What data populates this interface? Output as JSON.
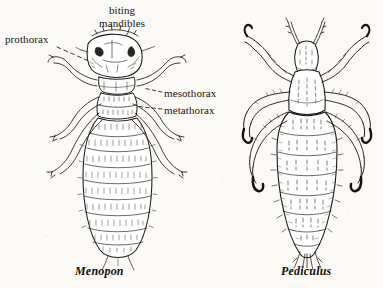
{
  "figure": {
    "kind": "scientific-illustration",
    "background_color": "#fbfaf7",
    "ink_color": "#1a1712"
  },
  "labels": {
    "biting_mandibles_line1": "biting",
    "biting_mandibles_line2": "mandibles",
    "prothorax": "prothorax",
    "mesothorax": "mesothorax",
    "metathorax": "metathorax"
  },
  "captions": {
    "left": "Menopon",
    "right": "Pediculus"
  },
  "specimens": [
    {
      "name": "Menopon",
      "position": "left",
      "head_shape": "broad-rounded",
      "leg_pairs": 3,
      "abdomen": "oval-segmented-bristled"
    },
    {
      "name": "Pediculus",
      "position": "right",
      "head_shape": "narrow-pointed",
      "leg_pairs": 3,
      "abdomen": "lobed-segmented-stippled"
    }
  ]
}
